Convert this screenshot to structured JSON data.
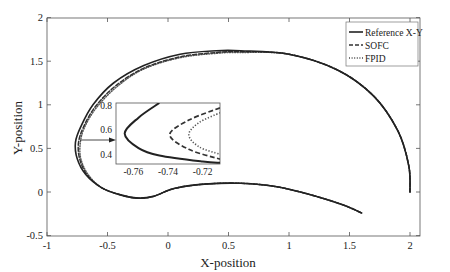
{
  "chart_data": {
    "type": "line",
    "title": "",
    "xlabel": "X-position",
    "ylabel": "Y-position",
    "xlim": [
      -1,
      2.1
    ],
    "ylim": [
      -0.5,
      2
    ],
    "xticks": [
      "-1",
      "-0.5",
      "0",
      "0.5",
      "1",
      "1.5",
      "2"
    ],
    "yticks": [
      "-0.5",
      "0",
      "0.5",
      "1",
      "1.5",
      "2"
    ],
    "grid": false,
    "legend_position": "upper right",
    "legend": [
      "Reference X-Y",
      "SOFC",
      "FPID"
    ],
    "series": [
      {
        "name": "Reference X-Y",
        "style": "solid",
        "x": [
          2.0,
          1.99,
          1.9,
          1.7,
          1.4,
          1.0,
          0.6,
          0.4,
          0.1,
          -0.2,
          -0.45,
          -0.62,
          -0.72,
          -0.765,
          -0.75,
          -0.68,
          -0.55,
          -0.4,
          -0.25,
          -0.12,
          0.05,
          0.3,
          0.6,
          0.9,
          1.2,
          1.45,
          1.6
        ],
        "y": [
          0.0,
          0.3,
          0.7,
          1.1,
          1.4,
          1.58,
          1.62,
          1.62,
          1.58,
          1.45,
          1.25,
          1.0,
          0.75,
          0.57,
          0.38,
          0.2,
          0.05,
          -0.03,
          -0.07,
          -0.05,
          0.04,
          0.09,
          0.1,
          0.06,
          -0.04,
          -0.15,
          -0.24
        ]
      },
      {
        "name": "SOFC",
        "style": "dashed",
        "x": [
          2.0,
          1.99,
          1.9,
          1.7,
          1.4,
          1.0,
          0.6,
          0.4,
          0.1,
          -0.2,
          -0.43,
          -0.6,
          -0.7,
          -0.74,
          -0.73,
          -0.67,
          -0.55,
          -0.4,
          -0.25,
          -0.12,
          0.05,
          0.3,
          0.6,
          0.9,
          1.2,
          1.45,
          1.6
        ],
        "y": [
          0.0,
          0.3,
          0.7,
          1.1,
          1.4,
          1.58,
          1.61,
          1.6,
          1.55,
          1.42,
          1.22,
          0.98,
          0.74,
          0.56,
          0.38,
          0.2,
          0.05,
          -0.03,
          -0.07,
          -0.05,
          0.04,
          0.09,
          0.1,
          0.06,
          -0.04,
          -0.15,
          -0.24
        ]
      },
      {
        "name": "FPID",
        "style": "dotted",
        "x": [
          2.0,
          1.99,
          1.9,
          1.7,
          1.4,
          1.0,
          0.6,
          0.4,
          0.1,
          -0.2,
          -0.42,
          -0.59,
          -0.69,
          -0.725,
          -0.72,
          -0.66,
          -0.55,
          -0.4,
          -0.25,
          -0.12,
          0.05,
          0.3,
          0.6,
          0.9,
          1.2,
          1.45,
          1.6
        ],
        "y": [
          0.0,
          0.3,
          0.7,
          1.1,
          1.4,
          1.58,
          1.6,
          1.59,
          1.54,
          1.41,
          1.21,
          0.97,
          0.74,
          0.56,
          0.38,
          0.2,
          0.05,
          -0.03,
          -0.07,
          -0.05,
          0.04,
          0.09,
          0.1,
          0.06,
          -0.04,
          -0.15,
          -0.24
        ]
      }
    ],
    "inset": {
      "xlim": [
        -0.77,
        -0.71
      ],
      "ylim": [
        0.32,
        0.82
      ],
      "xticks": [
        "-0.76",
        "-0.74",
        "-0.72"
      ],
      "yticks": [
        "0.4",
        "0.6",
        "0.8"
      ],
      "annotation": "arrow pointing from main curve at y≈0.57 to inset",
      "series": [
        {
          "name": "Reference X-Y",
          "style": "solid",
          "x": [
            -0.745,
            -0.757,
            -0.765,
            -0.757,
            -0.745,
            -0.72,
            -0.71
          ],
          "y": [
            0.82,
            0.7,
            0.57,
            0.45,
            0.39,
            0.34,
            0.33
          ]
        },
        {
          "name": "SOFC",
          "style": "dashed",
          "x": [
            -0.71,
            -0.728,
            -0.739,
            -0.728,
            -0.71
          ],
          "y": [
            0.78,
            0.68,
            0.56,
            0.44,
            0.36
          ]
        },
        {
          "name": "FPID",
          "style": "dotted",
          "x": [
            -0.71,
            -0.722,
            -0.728,
            -0.722,
            -0.71
          ],
          "y": [
            0.74,
            0.66,
            0.56,
            0.46,
            0.4
          ]
        }
      ]
    }
  },
  "labels": {
    "xlabel": "X-position",
    "ylabel": "Y-position",
    "legend_ref": "Reference X-Y",
    "legend_sofc": "SOFC",
    "legend_fpid": "FPID"
  }
}
